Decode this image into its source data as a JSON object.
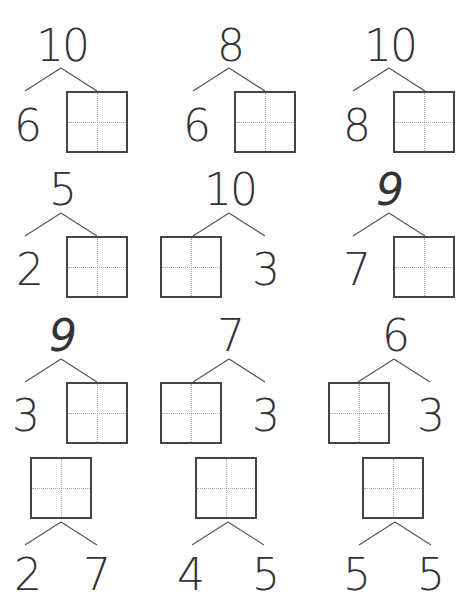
{
  "worksheet": {
    "title": "Number bonds",
    "problems": [
      {
        "whole": "10",
        "part_left": "6",
        "part_right": ""
      },
      {
        "whole": "8",
        "part_left": "6",
        "part_right": ""
      },
      {
        "whole": "10",
        "part_left": "8",
        "part_right": ""
      },
      {
        "whole": "5",
        "part_left": "2",
        "part_right": ""
      },
      {
        "whole": "10",
        "part_left": "",
        "part_right": "3"
      },
      {
        "whole": "9",
        "part_left": "7",
        "part_right": ""
      },
      {
        "whole": "9",
        "part_left": "3",
        "part_right": ""
      },
      {
        "whole": "7",
        "part_left": "",
        "part_right": "3"
      },
      {
        "whole": "6",
        "part_left": "",
        "part_right": "3"
      },
      {
        "whole": "",
        "part_left": "2",
        "part_right": "7"
      },
      {
        "whole": "",
        "part_left": "4",
        "part_right": "5"
      },
      {
        "whole": "",
        "part_left": "5",
        "part_right": "5"
      }
    ]
  }
}
